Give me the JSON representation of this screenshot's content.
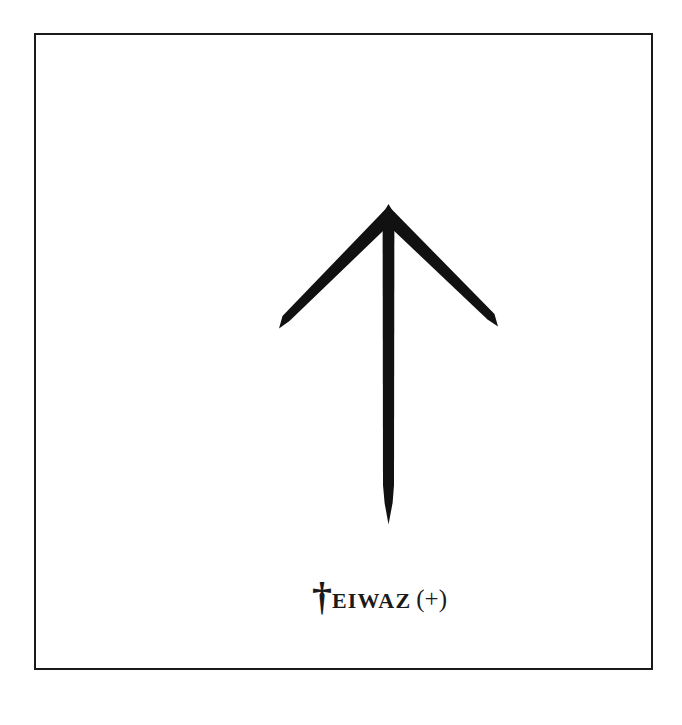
{
  "page": {
    "background_color": "#ffffff",
    "width": 682,
    "height": 725
  },
  "card": {
    "border_color": "#1a1a1a",
    "border_width_px": 2,
    "background_color": "#ffffff"
  },
  "rune": {
    "name": "teiwaz-rune",
    "icon_name": "upward-arrow-rune-icon",
    "description": "Teiwaz rune: upward pointing arrow with tapered arms and tapered stem",
    "ink_color": "#111111",
    "geometry": {
      "apex": [
        352,
        172
      ],
      "stem_tip": [
        352,
        489
      ],
      "left_arm_tip": [
        243,
        293
      ],
      "right_arm_tip": [
        462,
        291
      ],
      "stem_width_px": 12
    }
  },
  "caption": {
    "rune_letter": "†",
    "word": "EIWAZ",
    "full_text": "TEIWAZ (+)",
    "polarity_mark": "(+)",
    "text_color": "#1a1a1a"
  }
}
